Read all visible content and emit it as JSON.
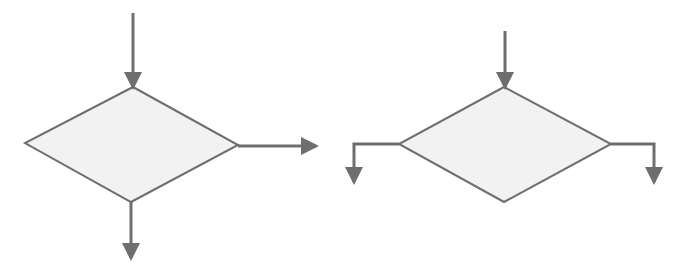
{
  "diagram": {
    "title": "",
    "colors": {
      "stroke": "#6e6e6e",
      "fill": "#f2f2f2",
      "background": "#ffffff"
    },
    "shapes": [
      {
        "id": "decision-1",
        "type": "diamond",
        "label": "",
        "points": {
          "top": [
            133,
            87
          ],
          "right": [
            238,
            145
          ],
          "bottom": [
            131,
            202
          ],
          "left": [
            25,
            143
          ]
        },
        "arrows": [
          {
            "id": "in",
            "direction": "down",
            "path": [
              [
                133,
                13
              ],
              [
                133,
                87
              ]
            ]
          },
          {
            "id": "out-right",
            "direction": "right",
            "path": [
              [
                238,
                146
              ],
              [
                316,
                146
              ]
            ]
          },
          {
            "id": "out-bottom",
            "direction": "down",
            "path": [
              [
                131,
                202
              ],
              [
                131,
                258
              ]
            ]
          }
        ]
      },
      {
        "id": "decision-2",
        "type": "diamond",
        "label": "",
        "points": {
          "top": [
            504,
            87
          ],
          "right": [
            611,
            144
          ],
          "bottom": [
            504,
            202
          ],
          "left": [
            399,
            144
          ]
        },
        "arrows": [
          {
            "id": "in",
            "direction": "down",
            "path": [
              [
                505,
                31
              ],
              [
                505,
                87
              ]
            ]
          },
          {
            "id": "out-left",
            "direction": "down",
            "path": [
              [
                399,
                144
              ],
              [
                354,
                144
              ],
              [
                354,
                182
              ]
            ]
          },
          {
            "id": "out-right",
            "direction": "down",
            "path": [
              [
                611,
                144
              ],
              [
                654,
                144
              ],
              [
                654,
                182
              ]
            ]
          }
        ]
      }
    ]
  }
}
